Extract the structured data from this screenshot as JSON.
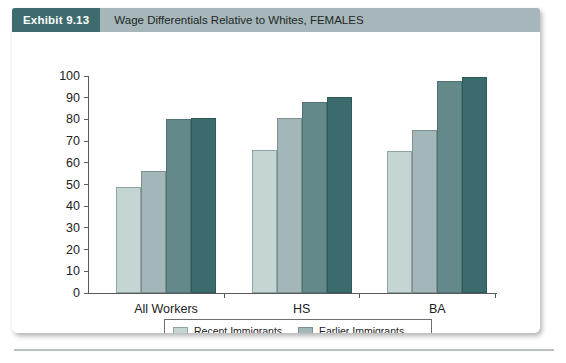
{
  "exhibit": {
    "badge": "Exhibit 9.13",
    "title": "Wage Differentials Relative to Whites, FEMALES"
  },
  "colors": {
    "header_bar": "#a7b6b8",
    "badge": "#3d6b6e",
    "series_1": "#c5d5d4",
    "series_2": "#a3b7b8",
    "series_3": "#63898a",
    "series_4": "#3c6b6d",
    "axis": "#5a5a5a"
  },
  "legend": {
    "entries": [
      {
        "label": "Recent Immigrants",
        "color": "#c5d5d4"
      },
      {
        "label": "Earlier Immigrants",
        "color": "#a3b7b8"
      },
      {
        "label": "Second Generation",
        "color": "#63898a"
      },
      {
        "label": "Third + Generation",
        "color": "#3c6b6d"
      }
    ]
  },
  "chart_data": {
    "type": "bar",
    "title": "Wage Differentials Relative to Whites, FEMALES",
    "xlabel": "",
    "ylabel": "",
    "ylim": [
      0,
      100
    ],
    "yticks": [
      0,
      10,
      20,
      30,
      40,
      50,
      60,
      70,
      80,
      90,
      100
    ],
    "ytick_labels": [
      "0",
      "10",
      "20",
      "30",
      "40",
      "50",
      "60",
      "70",
      "80",
      "90",
      "100"
    ],
    "grid": false,
    "legend_position": "bottom",
    "categories": [
      "All Workers",
      "HS",
      "BA"
    ],
    "series": [
      {
        "name": "Recent Immigrants",
        "values": [
          49,
          66,
          65.5
        ]
      },
      {
        "name": "Earlier Immigrants",
        "values": [
          56,
          80.5,
          75
        ]
      },
      {
        "name": "Second Generation",
        "values": [
          80,
          88,
          97.5
        ]
      },
      {
        "name": "Third + Generation",
        "values": [
          80.5,
          90.5,
          99.5
        ]
      }
    ]
  }
}
